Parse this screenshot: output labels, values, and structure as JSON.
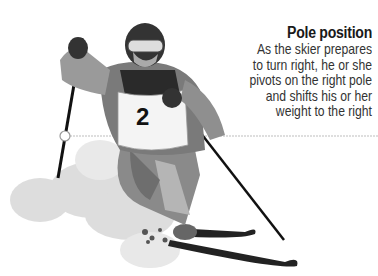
{
  "annotation": {
    "title": "Pole position",
    "lines": [
      "As the skier prepares",
      "to turn right, he or she",
      "pivots on the right pole",
      "and shifts his or her",
      "weight to the right"
    ]
  },
  "figure": {
    "subject": "skier",
    "bib_number": "2",
    "pointer_color": "#bdbdbd"
  }
}
